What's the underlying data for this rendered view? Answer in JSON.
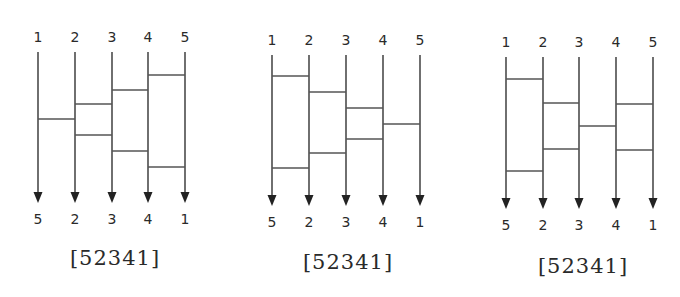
{
  "diagrams": [
    {
      "id": "amidakuji-1",
      "top_labels": [
        "1",
        "2",
        "3",
        "4",
        "5"
      ],
      "bottom_labels": [
        "5",
        "2",
        "3",
        "4",
        "1"
      ],
      "caption": "[52341]",
      "line_x": [
        38,
        75,
        112,
        148,
        185
      ],
      "label_top_y": 42,
      "line_top_y": 52,
      "arrow_tip_y": 203,
      "label_bottom_y": 224,
      "caption_x": 115,
      "caption_y": 265,
      "rungs": [
        {
          "between": [
            4,
            5
          ],
          "y": 75
        },
        {
          "between": [
            3,
            4
          ],
          "y": 90
        },
        {
          "between": [
            2,
            3
          ],
          "y": 104
        },
        {
          "between": [
            1,
            2
          ],
          "y": 119
        },
        {
          "between": [
            2,
            3
          ],
          "y": 135
        },
        {
          "between": [
            3,
            4
          ],
          "y": 151
        },
        {
          "between": [
            4,
            5
          ],
          "y": 167
        }
      ]
    },
    {
      "id": "amidakuji-2",
      "top_labels": [
        "1",
        "2",
        "3",
        "4",
        "5"
      ],
      "bottom_labels": [
        "5",
        "2",
        "3",
        "4",
        "1"
      ],
      "caption": "[52341]",
      "line_x": [
        272,
        309,
        346,
        383,
        420
      ],
      "label_top_y": 45,
      "line_top_y": 55,
      "arrow_tip_y": 206,
      "label_bottom_y": 227,
      "caption_x": 348,
      "caption_y": 269,
      "rungs": [
        {
          "between": [
            1,
            2
          ],
          "y": 76
        },
        {
          "between": [
            2,
            3
          ],
          "y": 92
        },
        {
          "between": [
            3,
            4
          ],
          "y": 108
        },
        {
          "between": [
            4,
            5
          ],
          "y": 124
        },
        {
          "between": [
            3,
            4
          ],
          "y": 139
        },
        {
          "between": [
            2,
            3
          ],
          "y": 153
        },
        {
          "between": [
            1,
            2
          ],
          "y": 168
        }
      ]
    },
    {
      "id": "amidakuji-3",
      "top_labels": [
        "1",
        "2",
        "3",
        "4",
        "5"
      ],
      "bottom_labels": [
        "5",
        "2",
        "3",
        "4",
        "1"
      ],
      "caption": "[52341]",
      "line_x": [
        506,
        543,
        579,
        616,
        653
      ],
      "label_top_y": 47,
      "line_top_y": 57,
      "arrow_tip_y": 209,
      "label_bottom_y": 230,
      "caption_x": 583,
      "caption_y": 273,
      "rungs": [
        {
          "between": [
            1,
            2
          ],
          "y": 79
        },
        {
          "between": [
            2,
            3
          ],
          "y": 103
        },
        {
          "between": [
            4,
            5
          ],
          "y": 104
        },
        {
          "between": [
            3,
            4
          ],
          "y": 126
        },
        {
          "between": [
            2,
            3
          ],
          "y": 149
        },
        {
          "between": [
            4,
            5
          ],
          "y": 150
        },
        {
          "between": [
            1,
            2
          ],
          "y": 171
        }
      ]
    }
  ]
}
